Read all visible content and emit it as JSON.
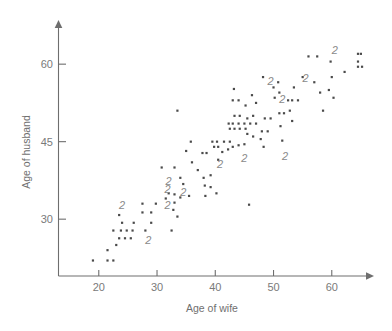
{
  "chart_data": {
    "type": "scatter",
    "title": "",
    "xlabel": "Age of wife",
    "ylabel": "Age of husband",
    "xlim": [
      13,
      66
    ],
    "ylim": [
      19,
      63
    ],
    "xticks": [
      20,
      30,
      40,
      50,
      60
    ],
    "xtick_labels": [
      "20",
      "30",
      "40",
      "50",
      "60"
    ],
    "yticks": [
      30,
      45,
      60
    ],
    "ytick_labels": [
      "30",
      "45",
      "60"
    ],
    "grid": false,
    "legend": null,
    "point_marker": "small-square-dot",
    "overlap_note": "Numerals mark locations where that many observations coincide",
    "points": [
      [
        19.0,
        22.0
      ],
      [
        21.5,
        22.0
      ],
      [
        22.5,
        22.0
      ],
      [
        21.5,
        24.0
      ],
      [
        23.0,
        25.0
      ],
      [
        23.5,
        26.3
      ],
      [
        24.5,
        26.3
      ],
      [
        25.5,
        26.3
      ],
      [
        22.5,
        27.8
      ],
      [
        23.8,
        27.8
      ],
      [
        24.8,
        27.8
      ],
      [
        25.8,
        27.8
      ],
      [
        28.0,
        27.8
      ],
      [
        32.5,
        27.8
      ],
      [
        24.0,
        29.3
      ],
      [
        26.0,
        29.3
      ],
      [
        29.0,
        29.3
      ],
      [
        23.5,
        30.8
      ],
      [
        27.5,
        31.3
      ],
      [
        29.0,
        31.3
      ],
      [
        33.5,
        30.5
      ],
      [
        32.8,
        31.8
      ],
      [
        33.0,
        33.2
      ],
      [
        31.5,
        34.0
      ],
      [
        32.0,
        35.0
      ],
      [
        33.0,
        34.8
      ],
      [
        34.0,
        34.2
      ],
      [
        35.5,
        34.5
      ],
      [
        30.8,
        40.0
      ],
      [
        33.0,
        40.0
      ],
      [
        34.0,
        38.0
      ],
      [
        35.8,
        45.0
      ],
      [
        35.0,
        43.2
      ],
      [
        33.5,
        51.0
      ],
      [
        37.8,
        42.8
      ],
      [
        38.5,
        42.8
      ],
      [
        38.0,
        38.0
      ],
      [
        39.2,
        38.5
      ],
      [
        38.2,
        36.5
      ],
      [
        39.2,
        36.2
      ],
      [
        38.3,
        34.5
      ],
      [
        40.2,
        35.0
      ],
      [
        39.5,
        45.0
      ],
      [
        40.3,
        45.0
      ],
      [
        41.5,
        45.0
      ],
      [
        42.5,
        45.0
      ],
      [
        39.8,
        44.0
      ],
      [
        40.5,
        44.0
      ],
      [
        41.2,
        43.0
      ],
      [
        42.2,
        43.5
      ],
      [
        43.0,
        44.0
      ],
      [
        44.0,
        44.3
      ],
      [
        45.0,
        44.5
      ],
      [
        42.5,
        47.5
      ],
      [
        43.3,
        47.5
      ],
      [
        44.2,
        47.5
      ],
      [
        45.2,
        47.5
      ],
      [
        42.3,
        48.5
      ],
      [
        43.0,
        48.5
      ],
      [
        44.0,
        48.5
      ],
      [
        45.0,
        48.5
      ],
      [
        43.3,
        50.0
      ],
      [
        44.2,
        50.0
      ],
      [
        43.0,
        53.0
      ],
      [
        44.0,
        53.0
      ],
      [
        43.2,
        55.2
      ],
      [
        45.2,
        52.0
      ],
      [
        45.8,
        32.8
      ],
      [
        45.5,
        46.5
      ],
      [
        46.5,
        46.0
      ],
      [
        46.0,
        48.5
      ],
      [
        47.0,
        48.5
      ],
      [
        46.5,
        50.0
      ],
      [
        45.5,
        49.5
      ],
      [
        47.0,
        52.5
      ],
      [
        46.3,
        54.0
      ],
      [
        47.8,
        45.5
      ],
      [
        48.3,
        44.0
      ],
      [
        48.0,
        47.0
      ],
      [
        49.0,
        47.0
      ],
      [
        48.5,
        49.5
      ],
      [
        49.5,
        49.5
      ],
      [
        48.2,
        57.5
      ],
      [
        50.0,
        55.5
      ],
      [
        50.2,
        53.5
      ],
      [
        50.8,
        56.5
      ],
      [
        51.0,
        54.5
      ],
      [
        51.0,
        50.5
      ],
      [
        51.8,
        50.5
      ],
      [
        51.5,
        45.2
      ],
      [
        51.2,
        48.0
      ],
      [
        52.5,
        53.0
      ],
      [
        53.2,
        53.0
      ],
      [
        52.8,
        51.0
      ],
      [
        53.5,
        55.5
      ],
      [
        53.2,
        49.0
      ],
      [
        54.2,
        53.0
      ],
      [
        55.0,
        57.5
      ],
      [
        56.0,
        61.5
      ],
      [
        57.5,
        61.5
      ],
      [
        57.0,
        56.5
      ],
      [
        58.0,
        54.5
      ],
      [
        58.5,
        51.0
      ],
      [
        59.5,
        55.0
      ],
      [
        59.8,
        60.5
      ],
      [
        60.0,
        57.5
      ],
      [
        60.3,
        53.5
      ],
      [
        62.2,
        58.5
      ],
      [
        64.5,
        62.0
      ],
      [
        65.0,
        62.0
      ],
      [
        64.5,
        60.5
      ],
      [
        64.5,
        59.5
      ],
      [
        65.2,
        59.5
      ],
      [
        36.0,
        41.0
      ],
      [
        37.0,
        39.5
      ],
      [
        40.5,
        41.5
      ],
      [
        34.5,
        36.8
      ],
      [
        29.8,
        33.0
      ],
      [
        27.5,
        33.0
      ]
    ],
    "overlap_markers": [
      {
        "label": "2",
        "x": 24.0,
        "y": 32.0
      },
      {
        "label": "2",
        "x": 28.5,
        "y": 25.2
      },
      {
        "label": "2",
        "x": 31.8,
        "y": 32.0
      },
      {
        "label": "2",
        "x": 31.8,
        "y": 35.0
      },
      {
        "label": "2",
        "x": 32.0,
        "y": 36.6
      },
      {
        "label": "2",
        "x": 34.5,
        "y": 34.5
      },
      {
        "label": "2",
        "x": 40.8,
        "y": 40.0
      },
      {
        "label": "2",
        "x": 45.0,
        "y": 41.0
      },
      {
        "label": "2",
        "x": 52.0,
        "y": 41.5
      },
      {
        "label": "2",
        "x": 51.5,
        "y": 52.5
      },
      {
        "label": "2",
        "x": 49.5,
        "y": 56.0
      },
      {
        "label": "2",
        "x": 55.5,
        "y": 56.5
      },
      {
        "label": "2",
        "x": 60.5,
        "y": 62.0
      }
    ]
  },
  "geometry": {
    "plot_left": 58,
    "plot_bottom": 276,
    "plot_right": 372,
    "plot_top": 22,
    "x_origin_value": 13,
    "y_origin_value": 19,
    "x_px_per_unit": 5.825,
    "y_px_per_unit": 5.1667
  }
}
